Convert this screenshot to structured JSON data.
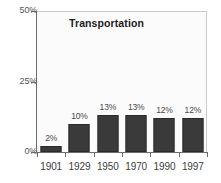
{
  "chart_data": {
    "type": "bar",
    "title": "Transportation",
    "xlabel": "",
    "ylabel": "",
    "categories": [
      "1901",
      "1929",
      "1950",
      "1970",
      "1990",
      "1997"
    ],
    "values": [
      2,
      10,
      13,
      13,
      12,
      12
    ],
    "data_labels": [
      "2%",
      "10%",
      "13%",
      "13%",
      "12%",
      "12%"
    ],
    "ylim": [
      0,
      50
    ],
    "ytick_values": [
      0,
      25,
      50
    ],
    "ytick_labels": [
      "0%",
      "25%",
      "50%"
    ],
    "grid": false,
    "legend": false,
    "bar_color": "#3a3a3a",
    "plot_background": "#fbfbfb",
    "axis_color": "#6d6d6d"
  }
}
